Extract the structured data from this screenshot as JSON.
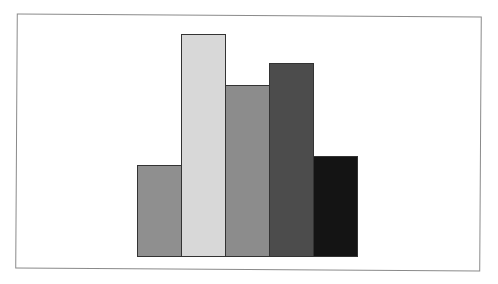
{
  "chart_data": {
    "type": "bar",
    "title": "",
    "xlabel": "",
    "ylabel": "",
    "categories": [
      "",
      "",
      "",
      "",
      ""
    ],
    "values": [
      41,
      100,
      77,
      87,
      45
    ],
    "colors": [
      "#8f8f8f",
      "#d8d8d8",
      "#8c8c8c",
      "#4c4c4c",
      "#141414"
    ],
    "ylim": [
      0,
      100
    ],
    "grid": false,
    "legend": null,
    "axes_visible": false,
    "bar_gap": 0,
    "edge_color": "#333333"
  },
  "layout": {
    "baseline_px": 256,
    "plot_height_px": 222,
    "bar_left_px": 137,
    "bar_width_px": 44
  }
}
